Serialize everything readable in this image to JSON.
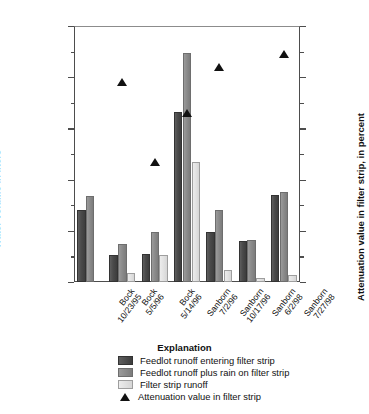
{
  "chart_data": {
    "type": "bar",
    "title": "",
    "categories": [
      "Bock\n10/23/95",
      "Bock\n5/5/96",
      "Bock\n5/14/96",
      "Sanborn\n7/2/96",
      "Sanborn\n10/17/96",
      "Sanborn\n6/2/98",
      "Sanborn\n7/27/98"
    ],
    "category_lines": [
      [
        "Bock",
        "10/23/95"
      ],
      [
        "Bock",
        "5/5/96"
      ],
      [
        "Bock",
        "5/14/96"
      ],
      [
        "Sanborn",
        "7/2/96"
      ],
      [
        "Sanborn",
        "10/17/96"
      ],
      [
        "Sanborn",
        "6/2/98"
      ],
      [
        "Sanborn",
        "7/27/98"
      ]
    ],
    "series": [
      {
        "name": "Feedlot runoff entering filter strip",
        "color": "#4a4a4a",
        "axis": "left",
        "values": [
          141000,
          52000,
          54000,
          332000,
          98000,
          80000,
          170000
        ]
      },
      {
        "name": "Feedlot runoff plus rain on filter strip",
        "color": "#8a8a8a",
        "axis": "left",
        "values": [
          168000,
          75000,
          98000,
          448000,
          141000,
          83000,
          176000
        ]
      },
      {
        "name": "Filter strip runoff",
        "color": "#e2e2e2",
        "axis": "left",
        "values": [
          0,
          17000,
          53000,
          235000,
          24000,
          8000,
          14000
        ]
      }
    ],
    "marker_series": {
      "name": "Attenuation value in filter strip",
      "color": "#111111",
      "axis": "right",
      "marker": "triangle-up",
      "values": [
        null,
        78,
        47,
        66,
        84,
        null,
        89
      ]
    },
    "xlabel": "",
    "ylabel": "Water volume in liters",
    "ylabel_right": "Attenuation value in filter strip, in percent",
    "ylim": [
      0,
      500000
    ],
    "ylim_right": [
      0,
      100
    ],
    "yticks": [
      0,
      100000,
      200000,
      300000,
      400000,
      500000
    ],
    "ytick_labels": [
      "0",
      "100,000",
      "200,000",
      "300,000",
      "400,000",
      "500,000"
    ],
    "yminor_step": 50000,
    "yticks_right": [
      0,
      20,
      40,
      60,
      80,
      100
    ],
    "ytick_labels_right": [
      "0",
      "20",
      "40",
      "60",
      "80",
      "100"
    ],
    "yminor_step_right": 10,
    "grid": false,
    "legend_position": "below"
  },
  "legend": {
    "title": "Explanation",
    "entries": [
      {
        "label": "Feedlot runoff entering filter strip",
        "swatch": "s0"
      },
      {
        "label": "Feedlot runoff plus rain on filter strip",
        "swatch": "s1"
      },
      {
        "label": "Filter strip runoff",
        "swatch": "s2"
      },
      {
        "label": "Attenuation value in filter strip",
        "swatch": "triangle"
      }
    ]
  }
}
